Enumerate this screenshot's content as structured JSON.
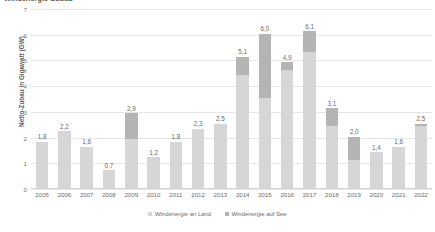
{
  "chart_data": {
    "type": "bar",
    "stacked": true,
    "title": "Windenergie-Zubau",
    "xlabel": "",
    "ylabel": "Netto-Zubau in Gigawatt (GW)",
    "ylim": [
      0,
      7
    ],
    "yticks": [
      0,
      1,
      2,
      3,
      4,
      5,
      6,
      7
    ],
    "grid": true,
    "legend_position": "bottom",
    "categories": [
      "2005",
      "2006",
      "2007",
      "2008",
      "2009",
      "2010",
      "2011",
      "2012",
      "2013",
      "2014",
      "2015",
      "2016",
      "2017",
      "2018",
      "2019",
      "2020",
      "2021",
      "2022"
    ],
    "series": [
      {
        "name": "Windenergie an Land",
        "color": "#d6d6d6",
        "values": [
          1.8,
          2.2,
          1.6,
          0.7,
          1.9,
          1.2,
          1.8,
          2.3,
          2.5,
          4.4,
          3.5,
          4.6,
          5.3,
          2.4,
          1.1,
          1.4,
          1.6,
          2.4
        ]
      },
      {
        "name": "Windenergie auf See",
        "color": "#b4b4b4",
        "values": [
          0.0,
          0.0,
          0.0,
          0.0,
          1.0,
          0.0,
          0.0,
          0.0,
          0.0,
          0.7,
          2.5,
          0.3,
          0.8,
          0.7,
          0.9,
          0.0,
          0.0,
          0.1
        ]
      }
    ],
    "totals": [
      "1,8",
      "2,2",
      "1,6",
      "0,7",
      "2,9",
      "1,2",
      "1,8",
      "2,3",
      "2,5",
      "5,1",
      "6,0",
      "4,9",
      "6,1",
      "3,1",
      "2,0",
      "1,4",
      "1,6",
      "2,5"
    ],
    "ytick_labels": [
      "0",
      "1",
      "2",
      "3",
      "4",
      "5",
      "6",
      "7"
    ]
  },
  "legend": {
    "items": [
      {
        "label": "Windenergie an Land",
        "color": "#d6d6d6"
      },
      {
        "label": "Windenergie auf See",
        "color": "#b4b4b4"
      }
    ]
  }
}
